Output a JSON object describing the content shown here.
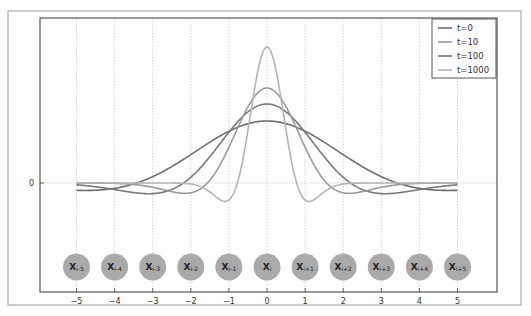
{
  "chart_data": {
    "type": "line",
    "title": "",
    "xlabel": "",
    "ylabel": "",
    "xlim": [
      -5.5,
      6.0
    ],
    "xticks": [
      -5,
      -4,
      -3,
      -2,
      -1,
      0,
      1,
      2,
      3,
      4,
      5
    ],
    "xtick_labels": [
      "−5",
      "−4",
      "−3",
      "−2",
      "−1",
      "0",
      "1",
      "2",
      "3",
      "4",
      "5"
    ],
    "yticks": [
      0
    ],
    "ytick_labels": [
      "0"
    ],
    "grid": true,
    "legend_position": "upper right",
    "series": [
      {
        "name": "t=0",
        "color": "#6e6e6e",
        "peak": 0.62,
        "width": 2.35,
        "trough": -0.13,
        "trough_x": 5.0,
        "note": "widest curve"
      },
      {
        "name": "t=10",
        "color": "#9a9a9a",
        "peak": 0.95,
        "width": 1.05,
        "trough": -0.19,
        "trough_x": 3.3,
        "note": "second tallest"
      },
      {
        "name": "t=100",
        "color": "#7a7a7a",
        "peak": 0.79,
        "width": 1.55,
        "trough": -0.19,
        "trough_x": 2.35,
        "note": "middle"
      },
      {
        "name": "t=1000",
        "color": "#b4b4b4",
        "peak": 1.36,
        "width": 0.55,
        "trough": -0.31,
        "trough_x": 1.25,
        "note": "narrow peak with side lobes"
      }
    ],
    "x_range_plotted": [
      -5,
      5
    ],
    "nodes": [
      {
        "x": -5,
        "label": "X",
        "sub": "i-5"
      },
      {
        "x": -4,
        "label": "X",
        "sub": "i-4"
      },
      {
        "x": -3,
        "label": "X",
        "sub": "i-3"
      },
      {
        "x": -2,
        "label": "X",
        "sub": "i-2"
      },
      {
        "x": -1,
        "label": "X",
        "sub": "i-1"
      },
      {
        "x": 0,
        "label": "X",
        "sub": "i"
      },
      {
        "x": 1,
        "label": "X",
        "sub": "i+1"
      },
      {
        "x": 2,
        "label": "X",
        "sub": "i+2"
      },
      {
        "x": 3,
        "label": "X",
        "sub": "i+3"
      },
      {
        "x": 4,
        "label": "X",
        "sub": "i+4"
      },
      {
        "x": 5,
        "label": "X",
        "sub": "i+5"
      }
    ],
    "node_color": "#aaaaaa"
  },
  "legend": {
    "items": [
      {
        "label": "t=0",
        "color": "#6e6e6e"
      },
      {
        "label": "t=10",
        "color": "#9a9a9a"
      },
      {
        "label": "t=100",
        "color": "#6e6e6e"
      },
      {
        "label": "t=1000",
        "color": "#b4b4b4"
      }
    ]
  }
}
